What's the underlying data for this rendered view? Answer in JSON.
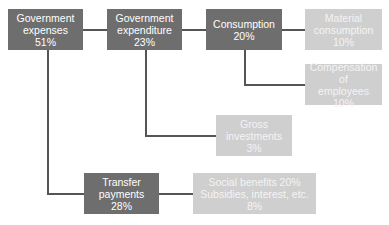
{
  "diagram": {
    "type": "hierarchy",
    "colors": {
      "primary_box": "#6e6e6e",
      "secondary_box": "#cfcfcf",
      "connector": "#555555"
    },
    "nodes": {
      "gov_expenses": {
        "line1": "Government",
        "line2": "expenses",
        "line3": "51%"
      },
      "gov_expenditure": {
        "line1": "Government",
        "line2": "expenditure",
        "line3": "23%"
      },
      "consumption": {
        "line1": "Consumption",
        "line2": "20%"
      },
      "material": {
        "line1": "Material",
        "line2": "consumption",
        "line3": "10%"
      },
      "compensation": {
        "line1": "Compensation of",
        "line2": "employees",
        "line3": "10%"
      },
      "gross_inv": {
        "line1": "Gross",
        "line2": "investments",
        "line3": "3%"
      },
      "transfer": {
        "line1": "Transfer",
        "line2": "payments",
        "line3": "28%"
      },
      "social": {
        "line1": "Social benefits 20%",
        "line2": "Subsidies, interest, etc. 8%"
      }
    },
    "edges": [
      [
        "Government expenses",
        "Government expenditure"
      ],
      [
        "Government expenditure",
        "Consumption"
      ],
      [
        "Consumption",
        "Material consumption"
      ],
      [
        "Consumption",
        "Compensation of employees"
      ],
      [
        "Government expenditure",
        "Gross investments"
      ],
      [
        "Government expenses",
        "Transfer payments"
      ],
      [
        "Transfer payments",
        "Social benefits / Subsidies, interest, etc."
      ]
    ]
  }
}
